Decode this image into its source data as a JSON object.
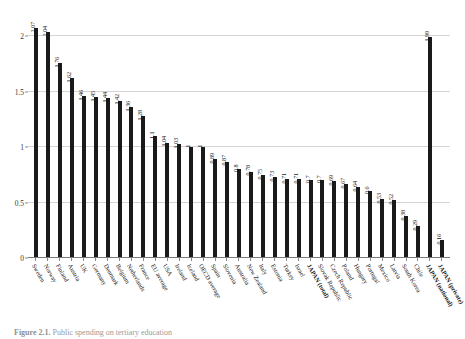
{
  "figure": {
    "caption_label": "Figure 2.1.",
    "caption_text": "Public spending on tertiary education"
  },
  "chart_data": {
    "type": "bar",
    "title": "",
    "xlabel": "",
    "ylabel": "",
    "ylim": [
      0,
      2.2
    ],
    "yticks": [
      "0",
      "0.5",
      "1",
      "1.5",
      "2"
    ],
    "ytick_values": [
      0,
      0.5,
      1,
      1.5,
      2
    ],
    "grid": true,
    "legend": "none",
    "bar_color": "#1a1a1a",
    "categories": [
      "Sweden",
      "Norway",
      "Finland",
      "Austria",
      "UK",
      "Germany",
      "Denmark",
      "Belgium",
      "Netherlands",
      "France",
      "EU average",
      "USA",
      "Ireland",
      "Iceland",
      "OECD average",
      "Spain",
      "Slovenia",
      "Australia",
      "New Zealand",
      "Italy",
      "Estonia",
      "Turkey",
      "Israel",
      "JAPAN (total)",
      "Slovak Republic",
      "Czech Republic",
      "Poland",
      "Hungary",
      "Portugal",
      "Mexico",
      "Latvia",
      "South Korea",
      "Chile",
      "JAPAN (national)",
      "JAPAN (private)"
    ],
    "values": [
      2.07,
      2.04,
      1.76,
      1.62,
      1.46,
      1.45,
      1.44,
      1.42,
      1.36,
      1.28,
      1.1,
      1.04,
      1.03,
      1,
      1,
      0.89,
      0.87,
      0.8,
      0.78,
      0.75,
      0.73,
      0.71,
      0.71,
      0.7,
      0.7,
      0.69,
      0.67,
      0.64,
      0.6,
      0.53,
      0.52,
      0.38,
      0.29,
      1.99,
      0.16
    ],
    "labels": [
      "2.07",
      "2.04",
      "1.76",
      "1.62",
      "1.46",
      "1.45",
      "1.44",
      "1.42",
      "1.36",
      "1.28",
      "1.1",
      "1.04",
      "1.03",
      "1",
      "1",
      "0.89",
      "0.87",
      "0.8",
      "0.78",
      "0.75",
      "0.73",
      "0.71",
      "0.71",
      "0.7",
      "0.7",
      "0.69",
      "0.67",
      "0.64",
      "0.6",
      "0.53",
      "0.52",
      "0.38",
      "0.29",
      "1.99",
      "0.16"
    ],
    "emphasized": [
      false,
      false,
      false,
      false,
      false,
      false,
      false,
      false,
      false,
      false,
      false,
      false,
      false,
      false,
      false,
      false,
      false,
      false,
      false,
      false,
      false,
      false,
      false,
      true,
      false,
      false,
      false,
      false,
      false,
      false,
      false,
      false,
      false,
      true,
      true
    ]
  }
}
